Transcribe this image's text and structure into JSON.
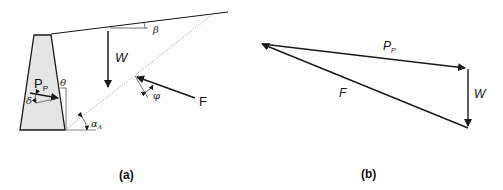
{
  "panel_a": {
    "caption": "(a)",
    "labels": {
      "beta": "β",
      "weight": "W",
      "theta": "θ",
      "passive_force_main": "P",
      "passive_force_sub": "P",
      "delta": "δ",
      "phi": "φ",
      "resultant": "F",
      "alpha_main": "α",
      "alpha_sub": "A"
    }
  },
  "panel_b": {
    "caption": "(b)",
    "labels": {
      "passive_force_main": "P",
      "passive_force_sub": "P",
      "weight": "W",
      "resultant": "F"
    }
  },
  "colors": {
    "wall_fill": "#e6e6e6",
    "line": "#1a1a1a",
    "dotted_plane": "#9a9a9a"
  }
}
